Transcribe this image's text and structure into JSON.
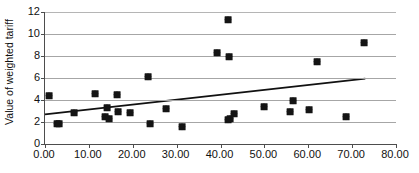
{
  "chart_data": {
    "type": "scatter",
    "title": "",
    "xlabel": "",
    "ylabel": "Value of weighted tariff",
    "xlim": [
      0,
      80
    ],
    "ylim": [
      0,
      12
    ],
    "grid": true,
    "legend": false,
    "x_ticks": [
      "0.00",
      "10.00",
      "20.00",
      "30.00",
      "40.00",
      "50.00",
      "60.00",
      "70.00",
      "80.00"
    ],
    "x_tick_values": [
      0,
      10,
      20,
      30,
      40,
      50,
      60,
      70,
      80
    ],
    "y_ticks": [
      "0",
      "2",
      "4",
      "6",
      "8",
      "10",
      "12"
    ],
    "y_tick_values": [
      0,
      2,
      4,
      6,
      8,
      10,
      12
    ],
    "marker": "diamond",
    "marker_color": "#141414",
    "points": [
      {
        "x": 0.8,
        "y": 4.4
      },
      {
        "x": 2.8,
        "y": 1.8
      },
      {
        "x": 3.1,
        "y": 1.8
      },
      {
        "x": 6.6,
        "y": 2.85
      },
      {
        "x": 11.3,
        "y": 4.55
      },
      {
        "x": 13.6,
        "y": 2.45
      },
      {
        "x": 14.1,
        "y": 3.3
      },
      {
        "x": 14.6,
        "y": 2.25
      },
      {
        "x": 16.3,
        "y": 4.45
      },
      {
        "x": 16.6,
        "y": 2.95
      },
      {
        "x": 19.3,
        "y": 2.8
      },
      {
        "x": 23.4,
        "y": 6.05
      },
      {
        "x": 23.9,
        "y": 1.85
      },
      {
        "x": 27.6,
        "y": 3.2
      },
      {
        "x": 31.2,
        "y": 1.55
      },
      {
        "x": 39.1,
        "y": 8.3
      },
      {
        "x": 41.7,
        "y": 11.25
      },
      {
        "x": 41.9,
        "y": 7.95
      },
      {
        "x": 41.8,
        "y": 2.2
      },
      {
        "x": 42.1,
        "y": 2.3
      },
      {
        "x": 43.0,
        "y": 2.7
      },
      {
        "x": 50.0,
        "y": 3.4
      },
      {
        "x": 55.9,
        "y": 2.95
      },
      {
        "x": 56.6,
        "y": 3.95
      },
      {
        "x": 60.2,
        "y": 3.05
      },
      {
        "x": 61.9,
        "y": 7.5
      },
      {
        "x": 68.6,
        "y": 2.45
      },
      {
        "x": 72.6,
        "y": 9.2
      }
    ],
    "trendline": {
      "type": "linear",
      "color": "#111111",
      "x_start": 0,
      "y_start": 2.7,
      "x_end": 73,
      "y_end": 5.95
    }
  }
}
